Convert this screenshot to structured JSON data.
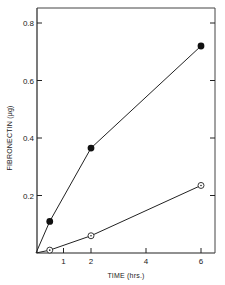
{
  "chart_data": {
    "type": "line",
    "title": "",
    "xlabel": "TIME (hrs.)",
    "ylabel": "FIBRONECTIN (μg)",
    "xlim": [
      0,
      6.5
    ],
    "ylim": [
      0,
      0.85
    ],
    "x_ticks": [
      1,
      2,
      4,
      6
    ],
    "x_tick_labels": [
      "1",
      "2",
      "4",
      "6"
    ],
    "y_ticks": [
      0.2,
      0.4,
      0.6,
      0.8
    ],
    "y_tick_labels": [
      "0.2",
      "0.4",
      "0.6",
      "0.8"
    ],
    "grid": false,
    "legend": null,
    "series": [
      {
        "name": "filled-circles",
        "marker": "filled-circle",
        "x": [
          0,
          0.5,
          2,
          6
        ],
        "y": [
          0,
          0.11,
          0.365,
          0.72
        ]
      },
      {
        "name": "open-circles",
        "marker": "open-circle-dot",
        "x": [
          0,
          0.5,
          2,
          6
        ],
        "y": [
          0,
          0.01,
          0.06,
          0.235
        ]
      }
    ]
  }
}
